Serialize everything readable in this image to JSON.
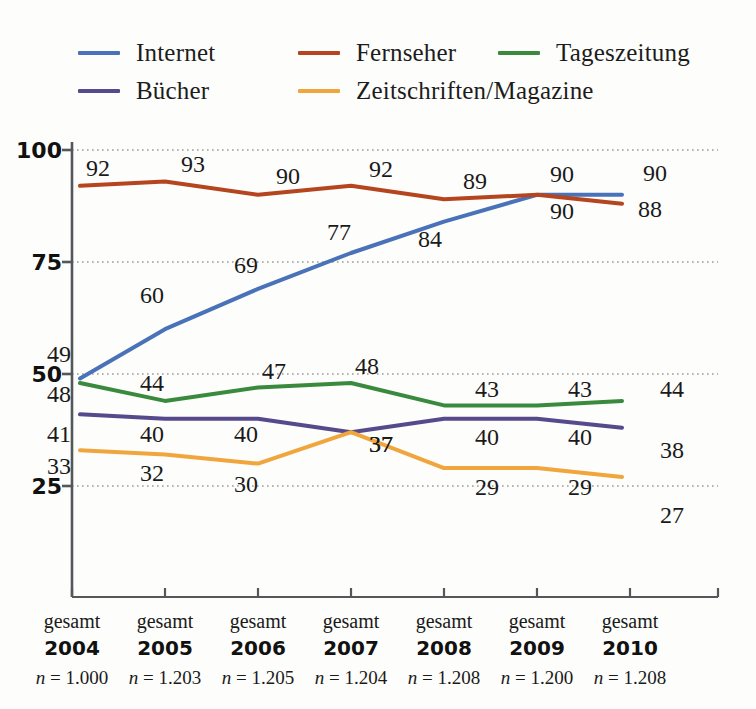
{
  "chart_data": {
    "type": "line",
    "title": "",
    "subtitle": "",
    "xlabel": "",
    "ylabel": "",
    "ylim": [
      0,
      100
    ],
    "yticks": [
      100,
      75,
      50,
      25
    ],
    "grid": "horizontal-dotted",
    "legend_position": "top-left",
    "categories": [
      "2004",
      "2005",
      "2006",
      "2007",
      "2008",
      "2009",
      "2010"
    ],
    "category_prefix": "gesamt",
    "sample_sizes": [
      "n = 1.000",
      "n = 1.203",
      "n = 1.205",
      "n = 1.204",
      "n = 1.208",
      "n = 1.200",
      "n = 1.208"
    ],
    "series": [
      {
        "name": "Internet",
        "color": "#4a72b8",
        "values": [
          49,
          60,
          69,
          77,
          84,
          90,
          90
        ]
      },
      {
        "name": "Fernseher",
        "color": "#b5451f",
        "values": [
          92,
          93,
          90,
          92,
          89,
          90,
          88
        ]
      },
      {
        "name": "Tageszeitung",
        "color": "#3a8a3e",
        "values": [
          48,
          44,
          47,
          48,
          43,
          43,
          44
        ]
      },
      {
        "name": "Bücher",
        "color": "#574a8c",
        "values": [
          41,
          40,
          40,
          37,
          40,
          40,
          38
        ]
      },
      {
        "name": "Zeitschriften/Magazine",
        "color": "#f0a63c",
        "values": [
          33,
          32,
          30,
          37,
          29,
          29,
          27
        ]
      }
    ]
  },
  "legend": {
    "rows": [
      [
        {
          "label": "Internet",
          "color": "#4a72b8"
        },
        {
          "label": "Fernseher",
          "color": "#b5451f"
        },
        {
          "label": "Tageszeitung",
          "color": "#3a8a3e"
        }
      ],
      [
        {
          "label": "Bücher",
          "color": "#574a8c"
        },
        {
          "label": "Zeitschriften/Magazine",
          "color": "#f0a63c"
        }
      ]
    ]
  },
  "axis": {
    "y_tick_labels": [
      "100",
      "75",
      "50",
      "25"
    ],
    "x_groups": [
      {
        "prefix": "gesamt",
        "year": "2004",
        "n": "n = 1.000"
      },
      {
        "prefix": "gesamt",
        "year": "2005",
        "n": "n = 1.203"
      },
      {
        "prefix": "gesamt",
        "year": "2006",
        "n": "n = 1.205"
      },
      {
        "prefix": "gesamt",
        "year": "2007",
        "n": "n = 1.204"
      },
      {
        "prefix": "gesamt",
        "year": "2008",
        "n": "n = 1.208"
      },
      {
        "prefix": "gesamt",
        "year": "2009",
        "n": "n = 1.200"
      },
      {
        "prefix": "gesamt",
        "year": "2010",
        "n": "n = 1.208"
      }
    ]
  },
  "colors": {
    "background": "#fdfdfb",
    "axis": "#55575a",
    "grid": "#9a9a9a",
    "text": "#1a1a1a"
  },
  "data_labels": [
    {
      "series": "Fernseher",
      "index": 0,
      "text": "92",
      "x": 98,
      "y": 168
    },
    {
      "series": "Fernseher",
      "index": 1,
      "text": "93",
      "x": 193,
      "y": 164
    },
    {
      "series": "Fernseher",
      "index": 2,
      "text": "90",
      "x": 288,
      "y": 176
    },
    {
      "series": "Fernseher",
      "index": 3,
      "text": "92",
      "x": 381,
      "y": 169
    },
    {
      "series": "Fernseher",
      "index": 4,
      "text": "89",
      "x": 475,
      "y": 181
    },
    {
      "series": "Fernseher",
      "index": 5,
      "text": "90",
      "x": 562,
      "y": 174
    },
    {
      "series": "Fernseher",
      "index": 6,
      "text": "88",
      "x": 650,
      "y": 209
    },
    {
      "series": "Internet",
      "index": 0,
      "text": "49",
      "x": 59,
      "y": 354
    },
    {
      "series": "Internet",
      "index": 1,
      "text": "60",
      "x": 152,
      "y": 295
    },
    {
      "series": "Internet",
      "index": 2,
      "text": "69",
      "x": 246,
      "y": 265
    },
    {
      "series": "Internet",
      "index": 3,
      "text": "77",
      "x": 339,
      "y": 232
    },
    {
      "series": "Internet",
      "index": 4,
      "text": "84",
      "x": 430,
      "y": 239
    },
    {
      "series": "Internet",
      "index": 5,
      "text": "90",
      "x": 562,
      "y": 211
    },
    {
      "series": "Internet",
      "index": 6,
      "text": "90",
      "x": 655,
      "y": 173
    },
    {
      "series": "Tageszeitung",
      "index": 0,
      "text": "48",
      "x": 59,
      "y": 394
    },
    {
      "series": "Tageszeitung",
      "index": 1,
      "text": "44",
      "x": 152,
      "y": 383
    },
    {
      "series": "Tageszeitung",
      "index": 2,
      "text": "47",
      "x": 274,
      "y": 371
    },
    {
      "series": "Tageszeitung",
      "index": 3,
      "text": "48",
      "x": 367,
      "y": 366
    },
    {
      "series": "Tageszeitung",
      "index": 4,
      "text": "43",
      "x": 487,
      "y": 389
    },
    {
      "series": "Tageszeitung",
      "index": 5,
      "text": "43",
      "x": 580,
      "y": 389
    },
    {
      "series": "Tageszeitung",
      "index": 6,
      "text": "44",
      "x": 672,
      "y": 389
    },
    {
      "series": "Bücher",
      "index": 0,
      "text": "41",
      "x": 59,
      "y": 434
    },
    {
      "series": "Bücher",
      "index": 1,
      "text": "40",
      "x": 152,
      "y": 434
    },
    {
      "series": "Bücher",
      "index": 2,
      "text": "40",
      "x": 246,
      "y": 434
    },
    {
      "series": "Bücher",
      "index": 3,
      "text": "37",
      "x": 381,
      "y": 444
    },
    {
      "series": "Bücher",
      "index": 4,
      "text": "40",
      "x": 487,
      "y": 437
    },
    {
      "series": "Bücher",
      "index": 5,
      "text": "40",
      "x": 580,
      "y": 437
    },
    {
      "series": "Bücher",
      "index": 6,
      "text": "38",
      "x": 672,
      "y": 450
    },
    {
      "series": "Zeitschriften/Magazine",
      "index": 0,
      "text": "33",
      "x": 59,
      "y": 466
    },
    {
      "series": "Zeitschriften/Magazine",
      "index": 1,
      "text": "32",
      "x": 152,
      "y": 473
    },
    {
      "series": "Zeitschriften/Magazine",
      "index": 2,
      "text": "30",
      "x": 246,
      "y": 484
    },
    {
      "series": "Zeitschriften/Magazine",
      "index": 3,
      "text": "37",
      "x": 381,
      "y": 444
    },
    {
      "series": "Zeitschriften/Magazine",
      "index": 4,
      "text": "29",
      "x": 487,
      "y": 487
    },
    {
      "series": "Zeitschriften/Magazine",
      "index": 5,
      "text": "29",
      "x": 580,
      "y": 487
    },
    {
      "series": "Zeitschriften/Magazine",
      "index": 6,
      "text": "27",
      "x": 672,
      "y": 515
    }
  ]
}
